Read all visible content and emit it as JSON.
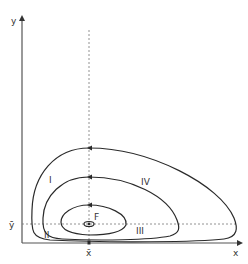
{
  "diagram": {
    "type": "phase-portrait",
    "axes": {
      "x_label": "x",
      "y_label": "y",
      "x_eq_label": "x̄",
      "y_eq_label": "ȳ"
    },
    "equilibrium_label": "F",
    "region_labels": [
      "I",
      "II",
      "III",
      "IV"
    ],
    "orbits": [
      {
        "name": "outer-orbit",
        "top": 43,
        "right": 236
      },
      {
        "name": "middle-orbit",
        "top": 90,
        "right": 178
      },
      {
        "name": "inner-orbit",
        "top": 136,
        "right": 126
      },
      {
        "name": "equilibrium-ellipse",
        "center": [
          89,
          224
        ]
      }
    ],
    "colors": {
      "stroke": "#2a2a2a",
      "axis": "#555555",
      "dashed": "#666666"
    }
  }
}
